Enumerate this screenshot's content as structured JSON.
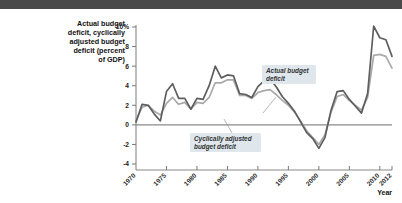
{
  "figure": {
    "y_axis_title": "Actual budget deficit, cyclically adjusted budget deficit (percent of GDP)",
    "y_axis_title_lines": [
      "Actual budget",
      "deficit, cyclically",
      "adjusted budget",
      "deficit (percent",
      "of GDP)"
    ],
    "x_axis_name": "Year",
    "callouts": [
      {
        "id": "actual",
        "lines": [
          "Actual budget",
          "deficit"
        ]
      },
      {
        "id": "cyclical",
        "lines": [
          "Cyclically adjusted",
          "budget deficit"
        ]
      }
    ],
    "colors": {
      "actual_line": "#5e5e5e",
      "cyclical_line": "#a9a9a9",
      "axis": "#7a7a7a",
      "zero_line": "#8a8a8a",
      "callout_bg": "#dfe7ec",
      "topbar": "#4a4a4a"
    }
  },
  "chart_data": {
    "type": "line",
    "title": "Actual budget deficit, cyclically adjusted budget deficit (percent of GDP)",
    "xlabel": "Year",
    "ylabel": "Actual budget deficit, cyclically adjusted budget deficit (percent of GDP)",
    "xlim": [
      1970,
      2012
    ],
    "ylim": [
      -4,
      10
    ],
    "yticks": [
      -4,
      -2,
      0,
      2,
      4,
      6,
      8,
      10
    ],
    "ytick_labels": [
      "-4",
      "-2",
      "0",
      "2",
      "4",
      "6",
      "8",
      "10%"
    ],
    "xticks": [
      1970,
      1975,
      1980,
      1985,
      1990,
      1995,
      2000,
      2005,
      2010,
      2012
    ],
    "xtick_labels": [
      "1970",
      "1975",
      "1980",
      "1985",
      "1990",
      "1995",
      "2000",
      "2005",
      "2010",
      "2012"
    ],
    "grid": false,
    "legend": "annotations",
    "x": [
      1970,
      1971,
      1972,
      1973,
      1974,
      1975,
      1976,
      1977,
      1978,
      1979,
      1980,
      1981,
      1982,
      1983,
      1984,
      1985,
      1986,
      1987,
      1988,
      1989,
      1990,
      1991,
      1992,
      1993,
      1994,
      1995,
      1996,
      1997,
      1998,
      1999,
      2000,
      2001,
      2002,
      2003,
      2004,
      2005,
      2006,
      2007,
      2008,
      2009,
      2010,
      2011,
      2012
    ],
    "series": [
      {
        "name": "Actual budget deficit",
        "color": "#5e5e5e",
        "values": [
          0.3,
          2.1,
          2.0,
          1.1,
          0.4,
          3.4,
          4.2,
          2.7,
          2.7,
          1.6,
          2.7,
          2.6,
          4.0,
          6.0,
          4.8,
          5.1,
          5.0,
          3.2,
          3.1,
          2.8,
          3.9,
          4.5,
          4.7,
          3.9,
          2.9,
          2.2,
          1.4,
          0.3,
          -0.8,
          -1.4,
          -2.4,
          -1.3,
          1.5,
          3.4,
          3.5,
          2.6,
          1.9,
          1.2,
          3.2,
          10.1,
          8.9,
          8.7,
          7.0
        ]
      },
      {
        "name": "Cyclically adjusted budget deficit",
        "color": "#a9a9a9",
        "values": [
          0.4,
          1.8,
          2.0,
          1.4,
          1.0,
          2.2,
          2.8,
          2.1,
          2.3,
          1.6,
          2.3,
          2.2,
          2.8,
          4.3,
          4.3,
          4.6,
          4.6,
          3.0,
          3.0,
          2.7,
          3.3,
          3.5,
          3.6,
          3.1,
          2.5,
          2.0,
          1.3,
          0.4,
          -0.6,
          -1.3,
          -2.0,
          -1.0,
          1.3,
          2.9,
          3.1,
          2.5,
          2.0,
          1.5,
          2.8,
          7.1,
          7.2,
          7.0,
          5.8
        ]
      }
    ]
  }
}
